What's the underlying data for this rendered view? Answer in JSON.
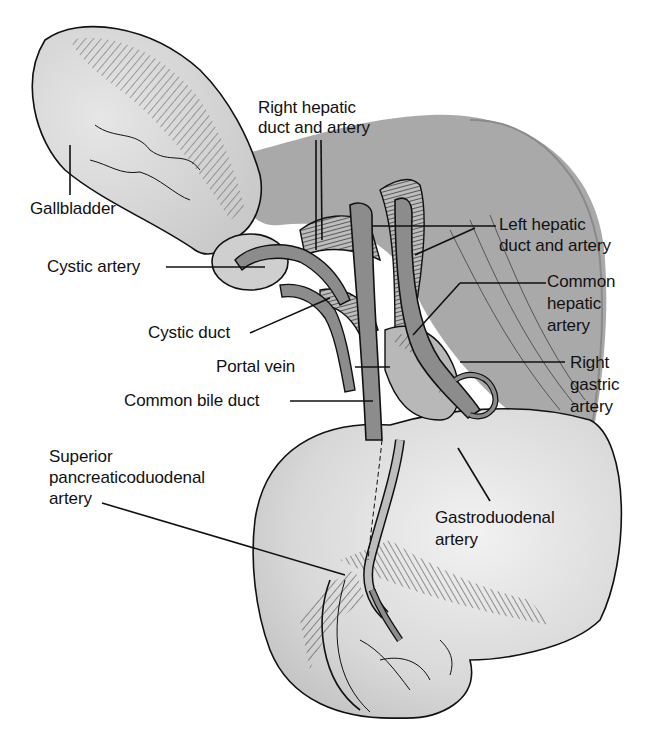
{
  "diagram": {
    "type": "anatomical illustration",
    "colors": {
      "background": "#ffffff",
      "organ_fill": "#d6d6d6",
      "liver_band": "#a9a9a9",
      "vessel_fill": "#8c8c8c",
      "outline": "#111111",
      "hatching": "#333333"
    },
    "labels": [
      {
        "id": "gallbladder",
        "text": "Gallbladder"
      },
      {
        "id": "right-hepatic",
        "line1": "Right hepatic",
        "line2": "duct and artery"
      },
      {
        "id": "left-hepatic",
        "line1": "Left hepatic",
        "line2": "duct and artery"
      },
      {
        "id": "cystic-artery",
        "text": "Cystic artery"
      },
      {
        "id": "common-hepatic",
        "line1": "Common",
        "line2": "hepatic",
        "line3": "artery"
      },
      {
        "id": "cystic-duct",
        "text": "Cystic duct"
      },
      {
        "id": "portal-vein",
        "text": "Portal vein"
      },
      {
        "id": "right-gastric",
        "line1": "Right",
        "line2": "gastric",
        "line3": "artery"
      },
      {
        "id": "common-bile-duct",
        "text": "Common bile duct"
      },
      {
        "id": "superior-pd",
        "line1": "Superior",
        "line2": "pancreaticoduodenal",
        "line3": "artery"
      },
      {
        "id": "gastroduodenal",
        "line1": "Gastroduodenal",
        "line2": "artery"
      }
    ]
  }
}
